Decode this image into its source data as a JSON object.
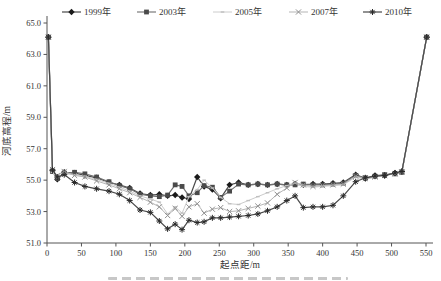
{
  "chart_data": {
    "type": "line",
    "title": "",
    "xlabel": "起点距/m",
    "ylabel": "河底高程/m",
    "xlim": [
      0,
      550
    ],
    "ylim": [
      51,
      65
    ],
    "x_ticks": [
      0,
      50,
      100,
      150,
      200,
      250,
      300,
      350,
      400,
      450,
      500,
      550
    ],
    "y_ticks": [
      51.0,
      53.0,
      55.0,
      57.0,
      59.0,
      61.0,
      63.0,
      65.0
    ],
    "grid": false,
    "legend_position": "top",
    "axis_color": "#555555",
    "text_color": "#333333",
    "x": [
      2,
      8,
      15,
      25,
      40,
      55,
      72,
      90,
      105,
      120,
      135,
      150,
      163,
      175,
      186,
      196,
      206,
      218,
      228,
      240,
      252,
      265,
      278,
      292,
      306,
      320,
      334,
      348,
      360,
      372,
      386,
      400,
      415,
      430,
      448,
      462,
      476,
      490,
      505,
      515,
      551
    ],
    "series": [
      {
        "name": "1999年",
        "marker": "diamond",
        "line_color": "#4a4a4a",
        "marker_color": "#1a1a1a",
        "line_width": 1.2,
        "values": [
          64.1,
          55.6,
          55.05,
          55.5,
          55.45,
          55.3,
          55.15,
          54.85,
          54.7,
          54.5,
          54.15,
          54.05,
          54.1,
          54.0,
          54.05,
          53.9,
          53.8,
          55.2,
          54.6,
          54.4,
          53.85,
          54.7,
          54.85,
          54.7,
          54.75,
          54.7,
          54.75,
          54.7,
          54.75,
          54.7,
          54.75,
          54.75,
          54.8,
          54.85,
          55.35,
          55.1,
          55.3,
          55.3,
          55.45,
          55.55,
          64.1
        ]
      },
      {
        "name": "2003年",
        "marker": "square",
        "line_color": "#6e6e6e",
        "marker_color": "#4a4a4a",
        "line_width": 1.1,
        "values": [
          64.1,
          55.55,
          55.1,
          55.45,
          55.5,
          55.4,
          55.2,
          54.9,
          54.65,
          54.45,
          54.1,
          54.0,
          53.95,
          54.05,
          54.7,
          54.6,
          54.0,
          54.2,
          54.65,
          54.55,
          53.9,
          54.3,
          54.75,
          54.7,
          54.75,
          54.7,
          54.75,
          54.7,
          54.7,
          54.75,
          54.7,
          54.7,
          54.75,
          54.8,
          55.3,
          55.15,
          55.25,
          55.35,
          55.4,
          55.5,
          64.1
        ]
      },
      {
        "name": "2005年",
        "marker": "dash",
        "line_color": "#cccccc",
        "marker_color": "#bfbfbf",
        "line_width": 1.0,
        "values": [
          64.1,
          55.5,
          55.15,
          55.4,
          55.35,
          55.25,
          55.05,
          54.8,
          54.55,
          54.3,
          54.0,
          53.8,
          53.6,
          52.85,
          53.3,
          52.9,
          53.95,
          54.4,
          55.0,
          54.5,
          53.9,
          53.5,
          53.45,
          53.7,
          53.95,
          54.2,
          54.45,
          54.65,
          54.8,
          54.6,
          54.55,
          54.6,
          54.65,
          54.7,
          55.2,
          55.05,
          55.2,
          55.3,
          55.4,
          55.5,
          64.1
        ]
      },
      {
        "name": "2007年",
        "marker": "x",
        "line_color": "#b5b5b5",
        "marker_color": "#8f8f8f",
        "line_width": 1.0,
        "values": [
          64.1,
          55.65,
          55.3,
          55.55,
          55.3,
          55.2,
          54.95,
          54.7,
          54.45,
          54.2,
          53.9,
          53.6,
          53.3,
          52.75,
          53.2,
          52.7,
          53.3,
          53.5,
          52.9,
          53.15,
          53.25,
          53.0,
          53.05,
          53.2,
          53.35,
          53.55,
          54.1,
          54.5,
          54.85,
          54.7,
          54.6,
          54.65,
          54.7,
          54.75,
          55.25,
          55.1,
          55.2,
          55.3,
          55.4,
          55.5,
          64.1
        ]
      },
      {
        "name": "2010年",
        "marker": "asterisk",
        "line_color": "#4a4a4a",
        "marker_color": "#2a2a2a",
        "line_width": 1.2,
        "values": [
          64.1,
          55.65,
          55.2,
          55.35,
          54.85,
          54.6,
          54.45,
          54.3,
          54.1,
          53.7,
          53.1,
          52.95,
          52.4,
          51.9,
          52.2,
          51.85,
          52.45,
          52.3,
          52.35,
          52.6,
          52.6,
          52.65,
          52.7,
          52.75,
          52.85,
          53.05,
          53.3,
          53.7,
          54.0,
          53.25,
          53.3,
          53.3,
          53.4,
          54.0,
          54.9,
          55.15,
          55.25,
          55.3,
          55.45,
          55.55,
          64.1
        ]
      }
    ]
  }
}
